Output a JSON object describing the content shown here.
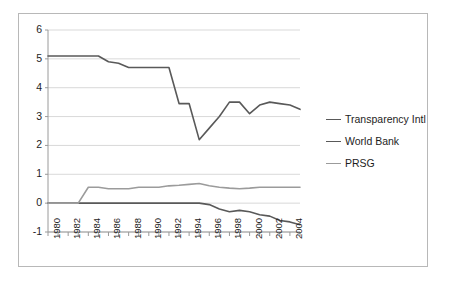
{
  "chart_data": {
    "type": "line",
    "title": "",
    "xlabel": "",
    "ylabel": "",
    "xlim": [
      1980,
      2005
    ],
    "ylim": [
      -1,
      6
    ],
    "yticks": [
      -1,
      0,
      1,
      2,
      3,
      4,
      5,
      6
    ],
    "xticks": [
      1980,
      1982,
      1984,
      1986,
      1988,
      1990,
      1992,
      1994,
      1996,
      1998,
      2000,
      2002,
      2004
    ],
    "x": [
      1980,
      1981,
      1982,
      1983,
      1984,
      1985,
      1986,
      1987,
      1988,
      1989,
      1990,
      1991,
      1992,
      1993,
      1994,
      1995,
      1996,
      1997,
      1998,
      1999,
      2000,
      2001,
      2002,
      2003,
      2004,
      2005
    ],
    "grid": true,
    "legend_position": "right",
    "series": [
      {
        "name": "Transparency Intl",
        "color": "#595959",
        "values": [
          5.1,
          5.1,
          5.1,
          5.1,
          5.1,
          5.1,
          4.9,
          4.85,
          4.7,
          4.7,
          4.7,
          4.7,
          4.7,
          3.45,
          3.45,
          2.2,
          2.6,
          3.0,
          3.5,
          3.5,
          3.1,
          3.4,
          3.5,
          3.45,
          3.4,
          3.25
        ]
      },
      {
        "name": "World Bank",
        "color": "#595959",
        "values": [
          0,
          0,
          0,
          0,
          0,
          0,
          0,
          0,
          0,
          0,
          0,
          0,
          0,
          0,
          0,
          0,
          -0.05,
          -0.2,
          -0.3,
          -0.25,
          -0.3,
          -0.4,
          -0.45,
          -0.6,
          -0.65,
          -0.75
        ]
      },
      {
        "name": "PRSG",
        "color": "#9b9b9b",
        "values": [
          0,
          0,
          0,
          0,
          0.55,
          0.55,
          0.5,
          0.5,
          0.5,
          0.55,
          0.55,
          0.55,
          0.6,
          0.62,
          0.65,
          0.68,
          0.6,
          0.55,
          0.52,
          0.5,
          0.52,
          0.55,
          0.55,
          0.55,
          0.55,
          0.55
        ]
      }
    ],
    "legend": [
      {
        "label": "Transparency Intl",
        "color": "#595959"
      },
      {
        "label": "World Bank",
        "color": "#595959"
      },
      {
        "label": "PRSG",
        "color": "#9b9b9b"
      }
    ]
  },
  "axis": {
    "y_labels": [
      "6",
      "5",
      "4",
      "3",
      "2",
      "1",
      "0",
      "-1"
    ],
    "x_labels": [
      "1980",
      "1982",
      "1984",
      "1986",
      "1988",
      "1990",
      "1992",
      "1994",
      "1996",
      "1998",
      "2000",
      "2002",
      "2004"
    ]
  }
}
